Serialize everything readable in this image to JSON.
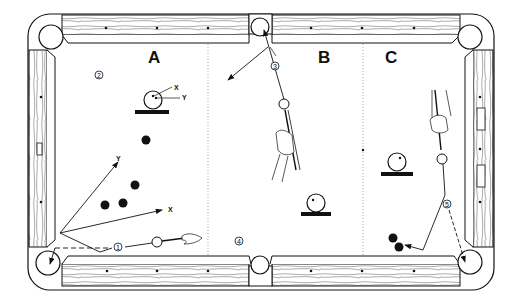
{
  "diagram": {
    "sections": [
      {
        "id": "A",
        "label": "A"
      },
      {
        "id": "B",
        "label": "B"
      },
      {
        "id": "C",
        "label": "C"
      }
    ],
    "markers": [
      {
        "id": "1",
        "label": "1"
      },
      {
        "id": "2",
        "label": "2"
      },
      {
        "id": "3",
        "label": "3"
      },
      {
        "id": "4",
        "label": "4"
      },
      {
        "id": "5",
        "label": "5"
      }
    ],
    "axis_labels": {
      "x_small": "X",
      "y_small": "Y",
      "x_large": "X",
      "y_large": "Y"
    },
    "colors": {
      "ink": "#111111",
      "background": "#ffffff",
      "rail": "#ffffff"
    }
  }
}
